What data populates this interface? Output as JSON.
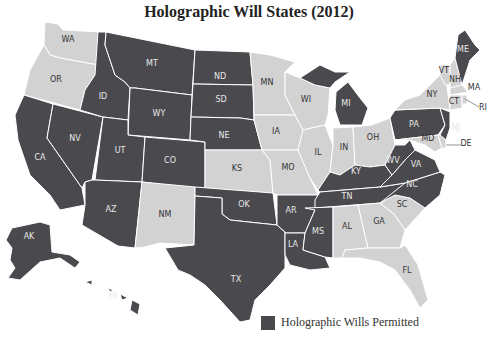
{
  "title": "Holographic Will States (2012)",
  "legend": {
    "label": "Holographic Wills Permitted",
    "color": "#4a4a4e"
  },
  "colors": {
    "permitted": "#4a4a4e",
    "not_permitted": "#d2d2d2",
    "border": "#ffffff",
    "label_on_dark": "#e8e8e8",
    "label_on_light": "#333333"
  },
  "chart_data": {
    "type": "choropleth",
    "title": "Holographic Will States (2012)",
    "legend": [
      "Holographic Wills Permitted"
    ],
    "permitted": [
      "AK",
      "HI",
      "CA",
      "NV",
      "ID",
      "MT",
      "WY",
      "UT",
      "CO",
      "AZ",
      "ND",
      "SD",
      "NE",
      "OK",
      "TX",
      "AR",
      "LA",
      "MS",
      "TN",
      "KY",
      "MI",
      "WV",
      "VA",
      "NC",
      "PA",
      "NJ",
      "ME"
    ],
    "not_permitted": [
      "WA",
      "OR",
      "NM",
      "KS",
      "MN",
      "IA",
      "MO",
      "WI",
      "IL",
      "IN",
      "OH",
      "AL",
      "GA",
      "SC",
      "FL",
      "NY",
      "VT",
      "NH",
      "MA",
      "CT",
      "RI",
      "MD",
      "DE"
    ]
  },
  "states": [
    {
      "code": "WA",
      "permitted": false,
      "label": "WA",
      "lx": 68,
      "ly": 42,
      "d": "M45,22 L58,24 L63,30 L100,32 L98,65 L60,58 L50,55 L44,45 Z"
    },
    {
      "code": "OR",
      "permitted": false,
      "label": "OR",
      "lx": 56,
      "ly": 82,
      "d": "M44,45 L50,55 L60,58 L98,65 L95,75 L85,90 L80,110 L24,95 L30,70 Z"
    },
    {
      "code": "CA",
      "permitted": true,
      "label": "CA",
      "lx": 40,
      "ly": 160,
      "d": "M24,95 L53,104 L47,138 L82,188 L85,205 L60,210 L50,195 L30,175 L18,140 L15,115 Z"
    },
    {
      "code": "NV",
      "permitted": true,
      "label": "NV",
      "lx": 75,
      "ly": 141,
      "d": "M53,104 L103,117 L92,180 L85,182 L82,188 L47,138 Z"
    },
    {
      "code": "ID",
      "permitted": true,
      "label": "ID",
      "lx": 103,
      "ly": 99,
      "d": "M98,32 L106,32 L105,45 L115,75 L125,82 L130,88 L128,120 L103,117 L80,110 L85,90 L95,75 Z"
    },
    {
      "code": "MT",
      "permitted": true,
      "label": "MT",
      "lx": 152,
      "ly": 66,
      "d": "M106,32 L195,50 L192,95 L135,88 L130,88 L125,82 L115,75 L105,45 Z"
    },
    {
      "code": "WY",
      "permitted": true,
      "label": "WY",
      "lx": 159,
      "ly": 116,
      "d": "M135,88 L192,95 L190,140 L128,135 L130,88 Z"
    },
    {
      "code": "UT",
      "permitted": true,
      "label": "UT",
      "lx": 120,
      "ly": 153,
      "d": "M103,117 L128,120 L128,135 L145,137 L142,182 L95,180 Z"
    },
    {
      "code": "CO",
      "permitted": true,
      "label": "CO",
      "lx": 170,
      "ly": 163,
      "d": "M145,137 L205,142 L205,190 L142,182 Z"
    },
    {
      "code": "AZ",
      "permitted": true,
      "label": "AZ",
      "lx": 111,
      "ly": 212,
      "d": "M95,180 L142,182 L135,248 L118,246 L82,225 L85,205 L85,182 L92,180 Z"
    },
    {
      "code": "NM",
      "permitted": false,
      "label": "NM",
      "lx": 165,
      "ly": 217,
      "d": "M142,182 L195,187 L194,245 L160,243 L145,247 L135,248 Z"
    },
    {
      "code": "ND",
      "permitted": true,
      "label": "ND",
      "lx": 220,
      "ly": 79,
      "d": "M195,50 L250,52 L253,85 L193,84 Z"
    },
    {
      "code": "SD",
      "permitted": true,
      "label": "SD",
      "lx": 221,
      "ly": 102,
      "d": "M193,84 L253,85 L254,120 L240,118 L191,117 Z"
    },
    {
      "code": "NE",
      "permitted": true,
      "label": "NE",
      "lx": 224,
      "ly": 138,
      "d": "M191,117 L240,118 L254,120 L262,150 L205,150 L205,142 L190,140 Z"
    },
    {
      "code": "KS",
      "permitted": false,
      "label": "KS",
      "lx": 237,
      "ly": 171,
      "d": "M205,150 L262,150 L270,160 L273,193 L205,190 Z"
    },
    {
      "code": "OK",
      "permitted": true,
      "label": "OK",
      "lx": 244,
      "ly": 207,
      "d": "M195,187 L273,193 L277,225 L258,223 L230,220 L222,214 L222,198 L195,196 Z"
    },
    {
      "code": "TX",
      "permitted": true,
      "label": "TX",
      "lx": 236,
      "ly": 282,
      "d": "M195,196 L222,198 L222,214 L230,220 L258,223 L277,225 L285,232 L285,268 L270,285 L255,300 L250,320 L240,322 L220,300 L205,285 L190,275 L178,270 L165,248 L194,245 Z"
    },
    {
      "code": "MN",
      "permitted": false,
      "label": "MN",
      "lx": 267,
      "ly": 85,
      "d": "M250,52 L270,55 L295,62 L285,72 L285,95 L295,115 L254,115 L253,85 Z"
    },
    {
      "code": "IA",
      "permitted": false,
      "label": "IA",
      "lx": 276,
      "ly": 134,
      "d": "M254,115 L295,115 L303,130 L298,150 L262,150 L254,120 Z"
    },
    {
      "code": "MO",
      "permitted": false,
      "label": "MO",
      "lx": 288,
      "ly": 170,
      "d": "M262,150 L298,150 L310,178 L318,195 L305,195 L277,195 L273,193 L270,160 Z"
    },
    {
      "code": "AR",
      "permitted": true,
      "label": "AR",
      "lx": 291,
      "ly": 213,
      "d": "M277,195 L318,195 L315,210 L305,233 L285,233 L285,232 L277,225 Z"
    },
    {
      "code": "LA",
      "permitted": true,
      "label": "LA",
      "lx": 293,
      "ly": 247,
      "d": "M285,233 L305,233 L303,250 L325,257 L330,268 L310,270 L290,265 L285,255 Z"
    },
    {
      "code": "WI",
      "permitted": false,
      "label": "WI",
      "lx": 306,
      "ly": 102,
      "d": "M285,72 L300,78 L315,85 L330,88 L328,115 L325,125 L303,130 L295,115 L285,95 Z"
    },
    {
      "code": "IL",
      "permitted": false,
      "label": "IL",
      "lx": 318,
      "ly": 155,
      "d": "M303,130 L325,125 L333,145 L330,172 L318,190 L310,178 L298,150 Z"
    },
    {
      "code": "MI",
      "permitted": true,
      "label": "MI",
      "lx": 346,
      "ly": 106,
      "d": "M300,78 L320,65 L335,72 L350,72 L335,82 L330,88 L315,85 Z M336,92 L348,82 L360,98 L368,108 L362,125 L340,125 L335,110 Z"
    },
    {
      "code": "IN",
      "permitted": false,
      "label": "IN",
      "lx": 344,
      "ly": 150,
      "d": "M333,128 L353,127 L355,165 L340,175 L330,172 L333,145 Z"
    },
    {
      "code": "OH",
      "permitted": false,
      "label": "OH",
      "lx": 373,
      "ly": 140,
      "d": "M353,127 L372,125 L390,118 L395,145 L385,165 L370,167 L355,165 Z"
    },
    {
      "code": "KY",
      "permitted": true,
      "label": "KY",
      "lx": 356,
      "ly": 174,
      "d": "M318,190 L330,172 L340,175 L355,165 L370,167 L385,165 L392,175 L380,187 L320,192 Z"
    },
    {
      "code": "TN",
      "permitted": true,
      "label": "TN",
      "lx": 347,
      "ly": 199,
      "d": "M315,200 L320,192 L380,187 L405,183 L395,195 L380,203 L315,208 Z"
    },
    {
      "code": "MS",
      "permitted": true,
      "label": "MS",
      "lx": 318,
      "ly": 234,
      "d": "M305,208 L333,207 L333,258 L325,257 L303,250 L305,233 L315,210 Z"
    },
    {
      "code": "AL",
      "permitted": false,
      "label": "AL",
      "lx": 347,
      "ly": 229,
      "d": "M333,207 L358,205 L368,248 L345,250 L342,258 L333,258 Z"
    },
    {
      "code": "GA",
      "permitted": false,
      "label": "GA",
      "lx": 379,
      "ly": 224,
      "d": "M358,205 L380,203 L395,215 L405,230 L400,248 L368,248 Z"
    },
    {
      "code": "FL",
      "permitted": false,
      "label": "FL",
      "lx": 407,
      "ly": 273,
      "d": "M345,250 L368,248 L400,248 L405,245 L418,265 L428,300 L420,308 L410,290 L395,270 L380,262 L360,258 L342,258 Z"
    },
    {
      "code": "SC",
      "permitted": false,
      "label": "SC",
      "lx": 402,
      "ly": 207,
      "d": "M380,203 L395,195 L410,198 L425,208 L405,230 L395,215 Z"
    },
    {
      "code": "NC",
      "permitted": true,
      "label": "NC",
      "lx": 412,
      "ly": 187,
      "d": "M380,203 L405,183 L440,172 L445,175 L440,195 L425,208 L410,198 L395,195 Z"
    },
    {
      "code": "VA",
      "permitted": true,
      "label": "VA",
      "lx": 416,
      "ly": 167,
      "d": "M392,175 L405,160 L415,150 L425,155 L435,160 L440,172 L405,183 L380,187 Z"
    },
    {
      "code": "WV",
      "permitted": true,
      "label": "WV",
      "lx": 393,
      "ly": 163,
      "d": "M385,165 L395,145 L405,145 L410,140 L415,150 L405,160 L392,175 Z"
    },
    {
      "code": "PA",
      "permitted": true,
      "label": "PA",
      "lx": 414,
      "ly": 127,
      "d": "M390,118 L395,110 L440,108 L445,125 L438,135 L395,140 Z"
    },
    {
      "code": "MD",
      "permitted": false,
      "label": "MD",
      "lx": 428,
      "ly": 141,
      "d": "M395,140 L438,135 L442,148 L435,152 L425,145 L410,140 Z"
    },
    {
      "code": "DE",
      "permitted": false,
      "label": "DE",
      "lx": 466,
      "ly": 146,
      "d": "M438,135 L445,135 L446,148 L442,148 Z"
    },
    {
      "code": "NJ",
      "permitted": true,
      "label": "NJ",
      "lx": 456,
      "ly": 130,
      "d": "M440,108 L450,112 L450,128 L446,140 L440,135 L445,125 Z"
    },
    {
      "code": "NY",
      "permitted": false,
      "label": "NY",
      "lx": 432,
      "ly": 97,
      "d": "M395,110 L405,100 L420,95 L440,75 L445,70 L450,110 L440,108 Z"
    },
    {
      "code": "VT",
      "permitted": false,
      "label": "VT",
      "lx": 444,
      "ly": 73,
      "d": "M440,65 L450,65 L450,85 L445,85 L440,75 Z"
    },
    {
      "code": "NH",
      "permitted": false,
      "label": "NH",
      "lx": 455,
      "ly": 82,
      "d": "M450,65 L455,58 L462,85 L450,88 Z"
    },
    {
      "code": "MA",
      "permitted": false,
      "label": "MA",
      "lx": 474,
      "ly": 90,
      "d": "M450,88 L462,85 L468,92 L450,95 Z"
    },
    {
      "code": "CT",
      "permitted": false,
      "label": "CT",
      "lx": 454,
      "ly": 104,
      "d": "M450,95 L462,95 L462,108 L450,110 Z"
    },
    {
      "code": "RI",
      "permitted": false,
      "label": "RI",
      "lx": 483,
      "ly": 110,
      "d": "M462,95 L467,95 L467,104 L462,104 Z"
    },
    {
      "code": "ME",
      "permitted": true,
      "label": "ME",
      "lx": 463,
      "ly": 52,
      "d": "M455,58 L458,35 L465,30 L475,45 L480,50 L470,60 L462,85 Z"
    },
    {
      "code": "AK",
      "permitted": true,
      "label": "AK",
      "lx": 29,
      "ly": 239,
      "d": "M12,228 L40,222 L50,225 L52,252 L70,255 L80,262 L75,268 L60,258 L40,262 L20,280 L8,278 L15,268 L10,260 L12,248 L6,240 Z"
    },
    {
      "code": "HI",
      "permitted": true,
      "label": "HI",
      "lx": 113,
      "ly": 298,
      "d": "M85,282 L92,280 L92,285 Z M108,288 L113,290 L110,292 Z M120,294 L128,298 L122,300 Z M132,300 L140,304 L138,315 L130,310 Z"
    }
  ],
  "leader_lines": [
    {
      "code": "RI",
      "x1": 465,
      "y1": 99,
      "x2": 479,
      "y2": 107
    },
    {
      "code": "DE",
      "x1": 446,
      "y1": 145,
      "x2": 461,
      "y2": 145
    }
  ]
}
